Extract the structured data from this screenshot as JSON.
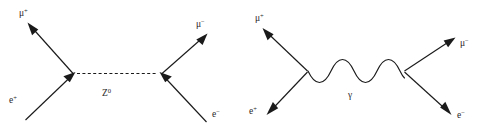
{
  "figure": {
    "background_color": "#ffffff",
    "line_color": "#1a1a1a",
    "label_color": "#2a2a2a",
    "width": 482,
    "height": 134
  },
  "diagrams": [
    {
      "id": "z-boson-exchange",
      "propagator": {
        "name": "Z0",
        "style": "dashed",
        "label_base": "Z",
        "label_sup": "0",
        "label_full": "Z⁰"
      },
      "legs": [
        {
          "id": "mu-plus-out",
          "label_base": "μ",
          "label_sup": "+",
          "label_full": "μ⁺",
          "position": "top-left"
        },
        {
          "id": "mu-minus-out",
          "label_base": "μ",
          "label_sup": "−",
          "label_full": "μ⁻",
          "position": "top-right"
        },
        {
          "id": "e-plus-in",
          "label_base": "e",
          "label_sup": "+",
          "label_full": "e⁺",
          "position": "bottom-left"
        },
        {
          "id": "e-minus-in",
          "label_base": "e",
          "label_sup": "−",
          "label_full": "e⁻",
          "position": "bottom-right"
        }
      ]
    },
    {
      "id": "photon-exchange",
      "propagator": {
        "name": "photon",
        "style": "wavy",
        "label_base": "γ",
        "label_sup": "",
        "label_full": "γ"
      },
      "legs": [
        {
          "id": "mu-plus-out",
          "label_base": "μ",
          "label_sup": "+",
          "label_full": "μ⁺",
          "position": "top-left"
        },
        {
          "id": "mu-minus-out",
          "label_base": "μ",
          "label_sup": "−",
          "label_full": "μ⁻",
          "position": "top-right"
        },
        {
          "id": "e-plus-out",
          "label_base": "e",
          "label_sup": "+",
          "label_full": "e⁺",
          "position": "bottom-left"
        },
        {
          "id": "e-minus-out",
          "label_base": "e",
          "label_sup": "−",
          "label_full": "e⁻",
          "position": "bottom-right"
        }
      ]
    }
  ],
  "labels": {
    "left_mu_plus_base": "μ",
    "left_mu_plus_sup": "+",
    "left_mu_minus_base": "μ",
    "left_mu_minus_sup": "−",
    "left_e_plus_base": "e",
    "left_e_plus_sup": "+",
    "left_e_minus_base": "e",
    "left_e_minus_sup": "−",
    "left_prop_base": "Z",
    "left_prop_sup": "0",
    "right_mu_plus_base": "μ",
    "right_mu_plus_sup": "+",
    "right_mu_minus_base": "μ",
    "right_mu_minus_sup": "−",
    "right_e_plus_base": "e",
    "right_e_plus_sup": "+",
    "right_e_minus_base": "e",
    "right_e_minus_sup": "−",
    "right_prop_base": "γ"
  }
}
